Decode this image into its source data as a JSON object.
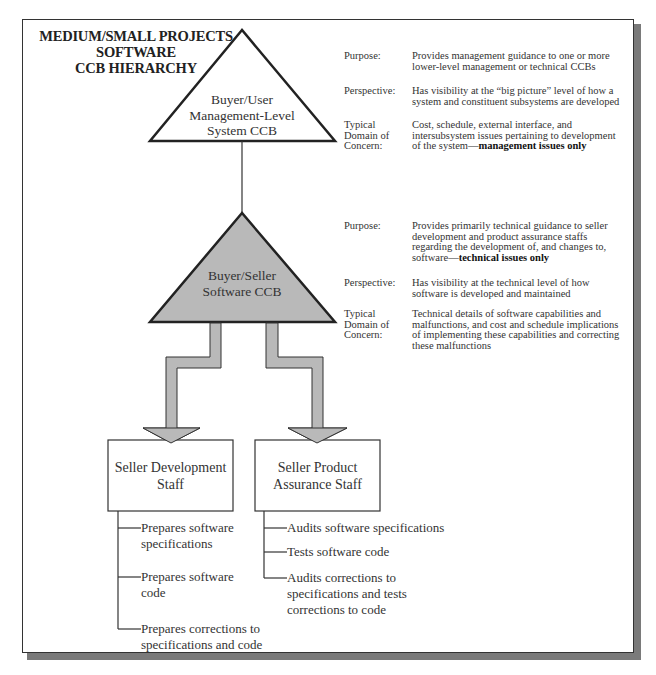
{
  "title": {
    "lines": [
      "MEDIUM/SMALL PROJECTS",
      "SOFTWARE",
      "CCB HIERARCHY"
    ]
  },
  "colors": {
    "frame": "#333333",
    "shadow": "#7a7a7a",
    "gray_fill": "#b9b9b9",
    "arrow_fill": "#b9b9b9",
    "text": "#333333"
  },
  "nodes": {
    "top_ccb": {
      "lines": [
        "Buyer/User",
        "Management-Level",
        "System CCB"
      ],
      "fill": "#ffffff"
    },
    "mid_ccb": {
      "lines": [
        "Buyer/Seller",
        "Software CCB"
      ],
      "fill": "#b9b9b9"
    },
    "seller_dev": {
      "lines": [
        "Seller Development",
        "Staff"
      ]
    },
    "seller_pa": {
      "lines": [
        "Seller Product",
        "Assurance Staff"
      ]
    }
  },
  "top_info": {
    "purpose": {
      "label": [
        "Purpose:"
      ],
      "text": [
        "Provides management guidance to one or more",
        "lower-level management or technical CCBs"
      ]
    },
    "perspective": {
      "label": [
        "Perspective:"
      ],
      "text": [
        "Has visibility at the “big picture” level of how a",
        "system and constituent subsystems are developed"
      ]
    },
    "domain": {
      "label": [
        "Typical",
        "Domain of",
        "Concern:"
      ],
      "text": [
        "Cost, schedule, external interface, and",
        "intersubsystem issues pertaining to development"
      ],
      "last_prefix": "of the system—",
      "last_bold": "management issues only"
    }
  },
  "mid_info": {
    "purpose": {
      "label": [
        "Purpose:"
      ],
      "text": [
        "Provides primarily technical guidance to seller",
        "development and product assurance staffs",
        "regarding the development of, and  changes to,"
      ],
      "last_prefix": "software—",
      "last_bold": "technical issues only"
    },
    "perspective": {
      "label": [
        "Perspective:"
      ],
      "text": [
        "Has visibility at the technical level of how",
        "software is developed and maintained"
      ]
    },
    "domain": {
      "label": [
        "Typical",
        "Domain of",
        "Concern:"
      ],
      "text": [
        "Technical details of software capabilities and",
        "malfunctions, and cost and schedule implications",
        "of implementing these capabilities and correcting",
        "these malfunctions"
      ]
    }
  },
  "dev_tasks": [
    {
      "lines": [
        "Prepares software",
        "specifications"
      ]
    },
    {
      "lines": [
        "Prepares software",
        "code"
      ]
    },
    {
      "lines": [
        "Prepares corrections to",
        "specifications and code"
      ]
    }
  ],
  "pa_tasks": [
    {
      "lines": [
        "Audits software specifications"
      ]
    },
    {
      "lines": [
        "Tests software code"
      ]
    },
    {
      "lines": [
        "Audits corrections to",
        "specifications and tests",
        "corrections to code"
      ]
    }
  ]
}
